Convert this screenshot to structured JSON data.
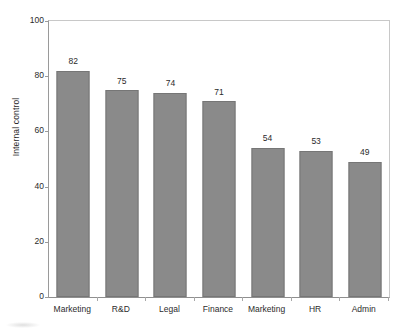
{
  "chart_data": {
    "type": "bar",
    "title": "",
    "subtitle": "",
    "xlabel": "",
    "ylabel": "Internal control",
    "categories": [
      "Marketing",
      "R&D",
      "Legal",
      "Finance",
      "Marketing",
      "HR",
      "Admin"
    ],
    "values": [
      82,
      75,
      74,
      71,
      54,
      53,
      49
    ],
    "value_labels": [
      "82",
      "75",
      "74",
      "71",
      "54",
      "53",
      "49"
    ],
    "ylim": [
      0,
      100
    ],
    "ytick_labels": [
      "100",
      "80",
      "60",
      "40",
      "20",
      "0"
    ],
    "ytick_values": [
      100,
      80,
      60,
      40,
      20,
      0
    ],
    "grid": false,
    "legend": null,
    "legend_position": "none",
    "series": [
      {
        "name": "Internal control",
        "values": [
          82,
          75,
          74,
          71,
          54,
          53,
          49
        ]
      }
    ],
    "colors": {
      "bar_fill": "#8a8a8a",
      "bar_border": "#767676",
      "axis_line": "#9a9a9a",
      "frame_line": "#c8c8c8",
      "text": "#2b2b2b",
      "background": "#ffffff"
    }
  }
}
